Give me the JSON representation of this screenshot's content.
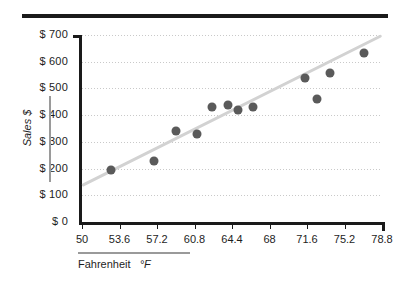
{
  "chart_data": {
    "type": "scatter",
    "title": "",
    "xlabel": "Fahrenheit  °F",
    "ylabel": "Sales $",
    "xlim": [
      50,
      78.8
    ],
    "ylim": [
      0,
      700
    ],
    "grid": true,
    "legend": "none",
    "x_tick_labels": [
      "50",
      "53.6",
      "57.2",
      "60.8",
      "64.4",
      "68",
      "71.6",
      "75.2",
      "78.8"
    ],
    "x_tick_values": [
      50,
      53.6,
      57.2,
      60.8,
      64.4,
      68,
      71.6,
      75.2,
      78.8
    ],
    "y_tick_labels": [
      "$ 700",
      "$ 600",
      "$ 500",
      "$ 400",
      "$ 300",
      "$ 200",
      "$ 100",
      "$ 0"
    ],
    "y_tick_values": [
      700,
      600,
      500,
      400,
      300,
      200,
      100,
      0
    ],
    "marker_color": "#5a5a5a",
    "trendline_color": "#d2d2d2",
    "gridline_color": "#c9c9c9",
    "axis_color": "#1a1a1a",
    "points": [
      {
        "x": 52.8,
        "y": 196
      },
      {
        "x": 56.9,
        "y": 227
      },
      {
        "x": 59.0,
        "y": 342
      },
      {
        "x": 61.0,
        "y": 331
      },
      {
        "x": 62.5,
        "y": 431
      },
      {
        "x": 64.0,
        "y": 438
      },
      {
        "x": 65.0,
        "y": 419
      },
      {
        "x": 66.4,
        "y": 431
      },
      {
        "x": 71.4,
        "y": 538
      },
      {
        "x": 72.6,
        "y": 462
      },
      {
        "x": 73.8,
        "y": 558
      },
      {
        "x": 77.1,
        "y": 631
      }
    ],
    "trendline": {
      "x0": 50,
      "y0": 138,
      "x1": 78.8,
      "y1": 700
    }
  },
  "axes": {
    "y_title": "Sales  $",
    "x_title_main": "Fahrenheit",
    "x_title_unit": "°F"
  }
}
